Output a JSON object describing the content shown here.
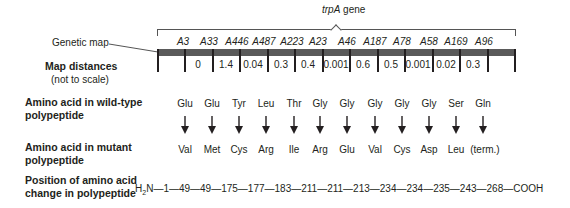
{
  "gene": {
    "name_italic": "trpA",
    "name_suffix": " gene"
  },
  "row_labels": {
    "genetic_map": "Genetic map",
    "map_distances": "Map distances",
    "not_to_scale": "(not to scale)",
    "wild_type_line1": "Amino acid in wild-type",
    "wild_type_line2": "polypeptide",
    "mutant_line1": "Amino acid in mutant",
    "mutant_line2": "polypeptide",
    "position_line1": "Position of amino acid",
    "position_line2": "change in polypeptide"
  },
  "mutations": [
    {
      "allele": "A3",
      "wild": "Glu",
      "mutant": "Val",
      "position": "49"
    },
    {
      "allele": "A33",
      "wild": "Glu",
      "mutant": "Met",
      "position": "49"
    },
    {
      "allele": "A446",
      "wild": "Tyr",
      "mutant": "Cys",
      "position": "175"
    },
    {
      "allele": "A487",
      "wild": "Leu",
      "mutant": "Arg",
      "position": "177"
    },
    {
      "allele": "A223",
      "wild": "Thr",
      "mutant": "Ile",
      "position": "183"
    },
    {
      "allele": "A23",
      "wild": "Gly",
      "mutant": "Arg",
      "position": "211"
    },
    {
      "allele": "A46",
      "wild": "Gly",
      "mutant": "Glu",
      "position": "211"
    },
    {
      "allele": "A187",
      "wild": "Gly",
      "mutant": "Val",
      "position": "213"
    },
    {
      "allele": "A78",
      "wild": "Gly",
      "mutant": "Cys",
      "position": "234"
    },
    {
      "allele": "A58",
      "wild": "Gly",
      "mutant": "Asp",
      "position": "234"
    },
    {
      "allele": "A169",
      "wild": "Ser",
      "mutant": "Leu",
      "position": "235"
    },
    {
      "allele": "A96",
      "wild": "Gln",
      "mutant": "(term.)",
      "position": "243"
    }
  ],
  "map_distances": [
    "0",
    "1.4",
    "0.04",
    "0.3",
    "0.4",
    "0.001",
    "0.6",
    "0.5",
    "0.001",
    "0.02",
    "0.3"
  ],
  "position_line": {
    "n_terminus_H": "H",
    "n_terminus_sub": "2",
    "n_terminus_N": "N",
    "sequence": "—1—49—49—175—177—183—211—211—213—234—234—235—243—268—COOH"
  }
}
